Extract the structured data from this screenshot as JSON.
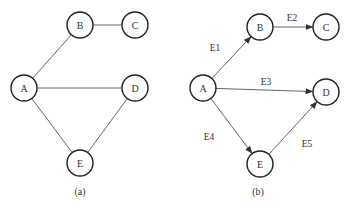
{
  "graphs": [
    {
      "id": "a",
      "caption": "(a)",
      "directed": false,
      "nodes": [
        {
          "id": "A",
          "label": "A",
          "x": 24,
          "y": 88
        },
        {
          "id": "B",
          "label": "B",
          "x": 80,
          "y": 25
        },
        {
          "id": "C",
          "label": "C",
          "x": 135,
          "y": 25
        },
        {
          "id": "D",
          "label": "D",
          "x": 135,
          "y": 88
        },
        {
          "id": "E",
          "label": "E",
          "x": 80,
          "y": 163
        }
      ],
      "edges": [
        {
          "from": "A",
          "to": "B",
          "label": ""
        },
        {
          "from": "B",
          "to": "C",
          "label": ""
        },
        {
          "from": "A",
          "to": "D",
          "label": ""
        },
        {
          "from": "A",
          "to": "E",
          "label": ""
        },
        {
          "from": "E",
          "to": "D",
          "label": ""
        }
      ],
      "caption_pos": {
        "x": 80,
        "y": 191
      }
    },
    {
      "id": "b",
      "caption": "(b)",
      "directed": true,
      "nodes": [
        {
          "id": "A",
          "label": "A",
          "x": 203,
          "y": 88
        },
        {
          "id": "B",
          "label": "B",
          "x": 260,
          "y": 27
        },
        {
          "id": "C",
          "label": "C",
          "x": 326,
          "y": 27
        },
        {
          "id": "D",
          "label": "D",
          "x": 326,
          "y": 92
        },
        {
          "id": "E",
          "label": "E",
          "x": 260,
          "y": 164
        }
      ],
      "edges": [
        {
          "from": "A",
          "to": "B",
          "label": "E1",
          "lx": 215,
          "ly": 48
        },
        {
          "from": "B",
          "to": "C",
          "label": "E2",
          "lx": 292,
          "ly": 18
        },
        {
          "from": "A",
          "to": "D",
          "label": "E3",
          "lx": 266,
          "ly": 82
        },
        {
          "from": "A",
          "to": "E",
          "label": "E4",
          "lx": 209,
          "ly": 137
        },
        {
          "from": "E",
          "to": "D",
          "label": "E5",
          "lx": 307,
          "ly": 144
        }
      ],
      "caption_pos": {
        "x": 258,
        "y": 191
      }
    }
  ],
  "style": {
    "node_radius": 13,
    "edge_color": "#555555",
    "node_stroke": "#222222"
  }
}
